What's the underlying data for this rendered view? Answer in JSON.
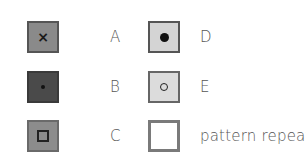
{
  "legend": {
    "items": [
      {
        "key": "A",
        "label": "A",
        "fill": "#8a8a8a",
        "border": "#555555",
        "mark": "x",
        "mark_icon": "cross-icon"
      },
      {
        "key": "B",
        "label": "B",
        "fill": "#4a4a4a",
        "border": "#3a3a3a",
        "mark": "small-dot",
        "mark_icon": "small-dot-icon"
      },
      {
        "key": "C",
        "label": "C",
        "fill": "#8c8c8c",
        "border": "#6a6a6a",
        "mark": "square",
        "mark_icon": "square-outline-icon"
      },
      {
        "key": "D",
        "label": "D",
        "fill": "#d4d4d4",
        "border": "#555555",
        "mark": "large-dot",
        "mark_icon": "large-dot-icon"
      },
      {
        "key": "E",
        "label": "E",
        "fill": "#dcdcdc",
        "border": "#666666",
        "mark": "ring",
        "mark_icon": "ring-icon"
      },
      {
        "key": "pattern-repeat",
        "label": "pattern repeat",
        "fill": "#ffffff",
        "border": "#7a7a7a",
        "mark": "none",
        "mark_icon": "empty-square-icon"
      }
    ]
  },
  "marks": {
    "x_glyph": "×"
  }
}
